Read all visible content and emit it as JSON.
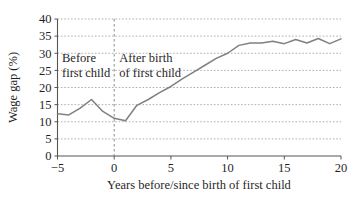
{
  "chart_data": {
    "type": "line",
    "title": "",
    "xlabel": "Years before/since birth of first child",
    "ylabel": "Wage gap (%)",
    "xlim": [
      -5,
      20
    ],
    "ylim": [
      0,
      40
    ],
    "xticks": [
      "-5",
      "0",
      "5",
      "10",
      "15",
      "20"
    ],
    "xtick_values": [
      -5,
      0,
      5,
      10,
      15,
      20
    ],
    "yticks": [
      "0",
      "5",
      "10",
      "15",
      "20",
      "25",
      "30",
      "35",
      "40"
    ],
    "ytick_values": [
      0,
      5,
      10,
      15,
      20,
      25,
      30,
      35,
      40
    ],
    "grid": "horizontal-dashed",
    "legend": "none",
    "series": [
      {
        "name": "Wage gap",
        "color": "#808080",
        "x": [
          -5,
          -4,
          -3,
          -2,
          -1,
          0,
          1,
          2,
          3,
          4,
          5,
          6,
          7,
          8,
          9,
          10,
          11,
          12,
          13,
          14,
          15,
          16,
          17,
          18,
          19,
          20
        ],
        "values": [
          12.3,
          12.0,
          14.0,
          16.5,
          13.0,
          11.0,
          10.3,
          14.8,
          16.5,
          18.5,
          20.3,
          22.5,
          24.5,
          26.5,
          28.5,
          30.0,
          32.3,
          33.0,
          33.0,
          33.5,
          32.8,
          34.0,
          33.0,
          34.3,
          32.8,
          34.2
        ]
      }
    ],
    "annotations": [
      {
        "name": "before-first-child",
        "lines": [
          "Before",
          "first child"
        ],
        "x": -4.6,
        "y": 27.5
      },
      {
        "name": "after-birth-of-first-child",
        "lines": [
          "After birth",
          "of first child"
        ],
        "x": 0.45,
        "y": 27.5
      }
    ],
    "reference_line": {
      "name": "birth-of-first-child",
      "orientation": "vertical",
      "x": 0,
      "style": "dashed",
      "color": "#8a8a8a"
    },
    "colors": {
      "line": "#808080",
      "grid": "#9a9a9a",
      "axis": "#555555",
      "text": "#1f1f1f",
      "background": "#ffffff"
    }
  }
}
